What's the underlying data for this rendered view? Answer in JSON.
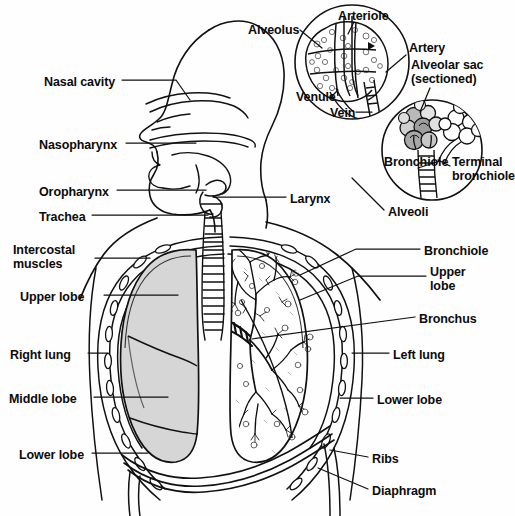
{
  "figure": {
    "type": "anatomical-diagram",
    "background_color": "#fefefe",
    "ink_color": "#111111",
    "lung_fill_color": "#d6d6d6",
    "lung_fill_light": "#e8e8e8"
  },
  "labels": {
    "left": [
      {
        "id": "nasal-cavity",
        "text": "Nasal cavity",
        "x": 44,
        "y": 75,
        "lines": 1
      },
      {
        "id": "nasopharynx",
        "text": "Nasopharynx",
        "x": 39,
        "y": 138,
        "lines": 1
      },
      {
        "id": "oropharynx",
        "text": "Oropharynx",
        "x": 39,
        "y": 185,
        "lines": 1
      },
      {
        "id": "trachea",
        "text": "Trachea",
        "x": 39,
        "y": 210,
        "lines": 1
      },
      {
        "id": "intercostal-muscles",
        "text": "Intercostal\nmuscles",
        "x": 13,
        "y": 243,
        "lines": 2
      },
      {
        "id": "upper-lobe-right",
        "text": "Upper lobe",
        "x": 20,
        "y": 290,
        "lines": 1
      },
      {
        "id": "right-lung",
        "text": "Right lung",
        "x": 10,
        "y": 348,
        "lines": 1
      },
      {
        "id": "middle-lobe",
        "text": "Middle lobe",
        "x": 9,
        "y": 392,
        "lines": 1
      },
      {
        "id": "lower-lobe-right",
        "text": "Lower lobe",
        "x": 19,
        "y": 448,
        "lines": 1
      }
    ],
    "right": [
      {
        "id": "larynx",
        "text": "Larynx",
        "x": 290,
        "y": 192,
        "lines": 1
      },
      {
        "id": "alveoli",
        "text": "Alveoli",
        "x": 388,
        "y": 205,
        "lines": 1
      },
      {
        "id": "bronchiole-lung",
        "text": "Bronchiole",
        "x": 424,
        "y": 244,
        "lines": 1
      },
      {
        "id": "upper-lobe-left",
        "text": "Upper\nlobe",
        "x": 430,
        "y": 265,
        "lines": 2
      },
      {
        "id": "bronchus",
        "text": "Bronchus",
        "x": 419,
        "y": 312,
        "lines": 1
      },
      {
        "id": "left-lung",
        "text": "Left lung",
        "x": 393,
        "y": 348,
        "lines": 1
      },
      {
        "id": "lower-lobe-left",
        "text": "Lower lobe",
        "x": 377,
        "y": 393,
        "lines": 1
      },
      {
        "id": "ribs",
        "text": "Ribs",
        "x": 372,
        "y": 452,
        "lines": 1
      },
      {
        "id": "diaphragm",
        "text": "Diaphragm",
        "x": 372,
        "y": 484,
        "lines": 1
      }
    ],
    "inset_alveolus": [
      {
        "id": "alveolus",
        "text": "Alveolus",
        "x": 248,
        "y": 23,
        "lines": 1
      },
      {
        "id": "arteriole",
        "text": "Arteriole",
        "x": 338,
        "y": 9,
        "lines": 1
      },
      {
        "id": "artery",
        "text": "Artery",
        "x": 409,
        "y": 41,
        "lines": 1
      },
      {
        "id": "alveolar-sac",
        "text": "Alveolar sac\n(sectioned)",
        "x": 411,
        "y": 58,
        "lines": 2
      },
      {
        "id": "venule",
        "text": "Venule",
        "x": 296,
        "y": 90,
        "lines": 1
      },
      {
        "id": "vein",
        "text": "Vein",
        "x": 330,
        "y": 106,
        "lines": 1
      }
    ],
    "inset_bronchiole": [
      {
        "id": "bronchiole-inset",
        "text": "Bronchiole",
        "x": 384,
        "y": 155,
        "lines": 1
      },
      {
        "id": "terminal-bronchiole",
        "text": "Terminal\nbronchiole",
        "x": 452,
        "y": 155,
        "lines": 2
      }
    ]
  }
}
